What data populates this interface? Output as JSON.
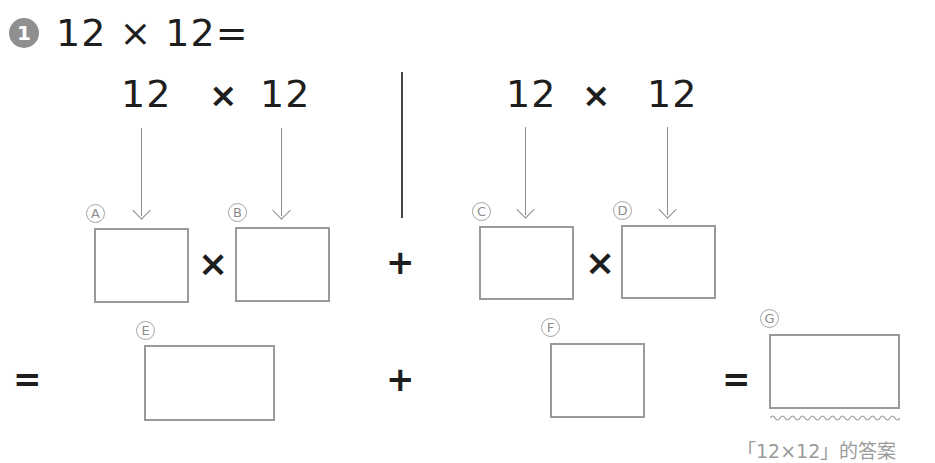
{
  "problem": {
    "number": "1",
    "expression": "12 × 12="
  },
  "left_group": {
    "factor_a": "12",
    "operator": "×",
    "factor_b": "12"
  },
  "right_group": {
    "factor_c": "12",
    "operator": "×",
    "factor_d": "12"
  },
  "row2": {
    "times_ab": "×",
    "plus": "+",
    "times_cd": "×"
  },
  "row3": {
    "equals_left": "=",
    "plus": "+",
    "equals_right": "="
  },
  "labels": {
    "a": "A",
    "b": "B",
    "c": "C",
    "d": "D",
    "e": "E",
    "f": "F",
    "g": "G"
  },
  "boxes": {
    "a": "",
    "b": "",
    "c": "",
    "d": "",
    "e": "",
    "f": "",
    "g": ""
  },
  "caption": "「12×12」的答案"
}
